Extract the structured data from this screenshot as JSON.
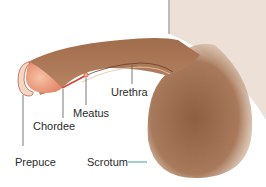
{
  "diagram": {
    "labels": [
      {
        "id": "urethra",
        "text": "Urethra"
      },
      {
        "id": "meatus",
        "text": "Meatus"
      },
      {
        "id": "chordee",
        "text": "Chordee"
      },
      {
        "id": "prepuce",
        "text": "Prepuce"
      },
      {
        "id": "scrotum",
        "text": "Scrotum"
      }
    ],
    "colors": {
      "skin_dark": "#8a5a3c",
      "skin_light": "#c99a78",
      "glans": "#eda07f",
      "chordee_line": "#d9483a",
      "leader_line": "#555555",
      "scrotum_leader": "#3a8f7a"
    }
  }
}
